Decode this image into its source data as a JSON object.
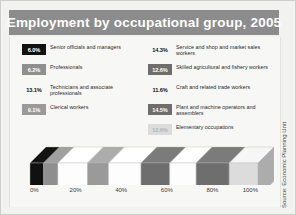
{
  "title": "Employment by occupational group, 2005",
  "source": "Source: Economic Planning Unit",
  "legend": {
    "left": [
      {
        "pct": "6.0%",
        "label": "Senior officials and managers",
        "swatch": "#111111",
        "text": "#ffffff"
      },
      {
        "pct": "6.2%",
        "label": "Professionals",
        "swatch": "#8f8f8f",
        "text": "#ffffff"
      },
      {
        "pct": "13.1%",
        "label": "Technicians and associate professionals",
        "swatch": "#fdfdfd",
        "text": "#111111"
      },
      {
        "pct": "9.1%",
        "label": "Clerical workers",
        "swatch": "#9a9a9a",
        "text": "#ffffff"
      }
    ],
    "right": [
      {
        "pct": "14.3%",
        "label": "Service and shop and market sales workers",
        "swatch": "#fdfdfd",
        "text": "#111111"
      },
      {
        "pct": "12.6%",
        "label": "Skilled agricultural and fishery workers",
        "swatch": "#6e6e6e",
        "text": "#ffffff"
      },
      {
        "pct": "11.6%",
        "label": "Craft and related trade workers",
        "swatch": "#fdfdfd",
        "text": "#111111"
      },
      {
        "pct": "14.5%",
        "label": "Plant and machine operators and assemblers",
        "swatch": "#6e6e6e",
        "text": "#ffffff"
      },
      {
        "pct": "12.6%",
        "label": "Elementary occupations",
        "swatch": "#dcdcdc",
        "text": "#b4b4b4"
      }
    ]
  },
  "axis": {
    "ticks": [
      "0%",
      "20%",
      "40%",
      "60%",
      "80%",
      "100%"
    ]
  },
  "chart_data": {
    "type": "bar",
    "orientation": "horizontal-stacked-3d",
    "title": "Employment by occupational group, 2005",
    "xlabel": "",
    "ylabel": "",
    "xlim": [
      0,
      100
    ],
    "grid": false,
    "legend_position": "top",
    "units": "percent",
    "categories": [
      "Senior officials and managers",
      "Professionals",
      "Technicians and associate professionals",
      "Clerical workers",
      "Service and shop and market sales workers",
      "Skilled agricultural and fishery workers",
      "Craft and related trade workers",
      "Plant and machine operators and assemblers",
      "Elementary occupations"
    ],
    "values": [
      6.0,
      6.2,
      13.1,
      9.1,
      14.3,
      12.6,
      11.6,
      14.5,
      12.6
    ],
    "colors": [
      "#111111",
      "#8f8f8f",
      "#fdfdfd",
      "#9a9a9a",
      "#fdfdfd",
      "#6e6e6e",
      "#fdfdfd",
      "#6e6e6e",
      "#dcdcdc"
    ],
    "tick_labels": [
      "0%",
      "20%",
      "40%",
      "60%",
      "80%",
      "100%"
    ],
    "total": 100.0
  }
}
